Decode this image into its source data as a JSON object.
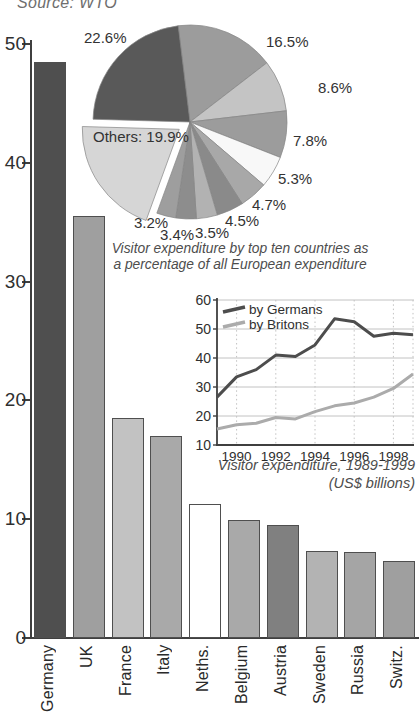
{
  "source_note": "Source: WTO",
  "chart_data": [
    {
      "id": "bar",
      "type": "bar",
      "title": "Visitor expenditure by country (US$ billions)",
      "categories": [
        "Germany",
        "UK",
        "France",
        "Italy",
        "Neths.",
        "Belgium",
        "Austria",
        "Sweden",
        "Russia",
        "Switz."
      ],
      "values": [
        48.5,
        35.5,
        18.5,
        17,
        11.3,
        9.9,
        9.5,
        7.3,
        7.2,
        6.5
      ],
      "bar_colors": [
        "#4f4f4f",
        "#9f9f9f",
        "#c2c2c2",
        "#a9a9a9",
        "#ffffff",
        "#a9a9a9",
        "#808080",
        "#b3b3b3",
        "#a5a5a5",
        "#9f9f9f"
      ],
      "y_ticks": [
        0,
        10,
        20,
        30,
        40,
        50
      ],
      "ylim": [
        0,
        50
      ],
      "xlabel": "",
      "ylabel": ""
    },
    {
      "id": "pie",
      "type": "pie",
      "caption_line1": "Visitor expenditure by top ten countries as",
      "caption_line2": "a percentage of all European expenditure",
      "start_angle_deg": -7,
      "slices": [
        {
          "label": "16.5%",
          "value": 16.5,
          "color": "#9c9c9c"
        },
        {
          "label": "8.6%",
          "value": 8.6,
          "color": "#c4c4c4"
        },
        {
          "label": "7.8%",
          "value": 7.8,
          "color": "#9c9c9c"
        },
        {
          "label": "5.3%",
          "value": 5.3,
          "color": "#f8f8f8"
        },
        {
          "label": "4.7%",
          "value": 4.7,
          "color": "#a8a8a8"
        },
        {
          "label": "4.5%",
          "value": 4.5,
          "color": "#8a8a8a"
        },
        {
          "label": "3.5%",
          "value": 3.5,
          "color": "#b2b2b2"
        },
        {
          "label": "3.4%",
          "value": 3.4,
          "color": "#8d8d8d"
        },
        {
          "label": "3.2%",
          "value": 3.2,
          "color": "#9e9e9e"
        },
        {
          "label": "Others: 19.9%",
          "value": 19.9,
          "color": "#d6d6d6",
          "exploded": true
        },
        {
          "label": "22.6%",
          "value": 22.6,
          "color": "#595959"
        }
      ]
    },
    {
      "id": "line",
      "type": "line",
      "caption_line1": "Visitor expenditure, 1989-1999",
      "caption_line2": "(US$ billions)",
      "x": [
        1989,
        1990,
        1991,
        1992,
        1993,
        1994,
        1995,
        1996,
        1997,
        1998,
        1999
      ],
      "x_ticks": [
        1990,
        1992,
        1994,
        1996,
        1998
      ],
      "y_ticks": [
        10,
        20,
        30,
        40,
        50,
        60
      ],
      "xlim": [
        1989,
        1999
      ],
      "ylim": [
        10,
        60
      ],
      "grid": true,
      "legend_position": "top-left",
      "series": [
        {
          "name": "by Germans",
          "color": "#4d4d4d",
          "values": [
            26.5,
            33.5,
            36,
            41,
            40.5,
            44.5,
            53.5,
            52.5,
            47.5,
            48.5,
            48
          ]
        },
        {
          "name": "by Britons",
          "color": "#ababab",
          "values": [
            15.5,
            17,
            17.5,
            19.5,
            19,
            21.5,
            23.5,
            24.5,
            26.5,
            29.5,
            34.5
          ]
        }
      ]
    }
  ]
}
